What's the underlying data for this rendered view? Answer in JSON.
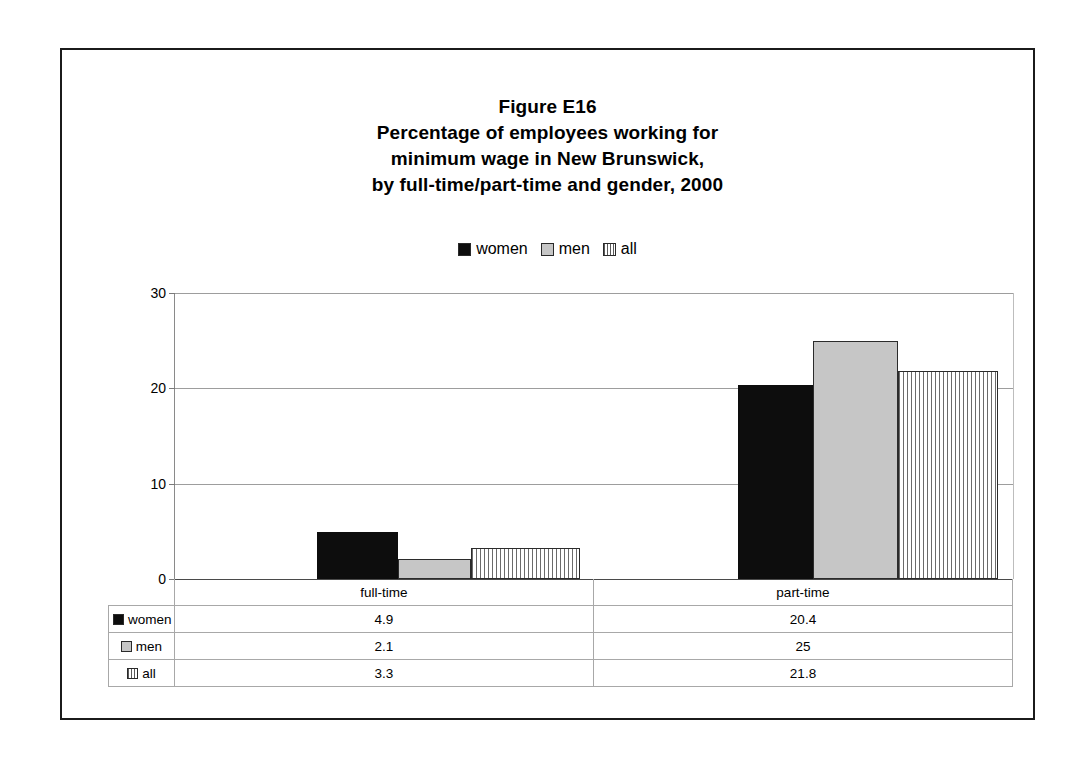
{
  "figure": {
    "title_lines": [
      "Figure E16",
      "Percentage of employees working for",
      "minimum wage in New Brunswick,",
      "by full-time/part-time and gender, 2000"
    ]
  },
  "legend": {
    "items": [
      {
        "label": "women",
        "swatch": "solid-black-swatch-icon",
        "color": "#0d0d0d"
      },
      {
        "label": "men",
        "swatch": "solid-gray-swatch-icon",
        "color": "#c6c6c6"
      },
      {
        "label": "all",
        "swatch": "vertical-stripe-swatch-icon",
        "color": "#ffffff"
      }
    ]
  },
  "axis": {
    "yticks": [
      "0",
      "10",
      "20",
      "30"
    ]
  },
  "table": {
    "row_label_header": "",
    "category_headers": [
      "full-time",
      "part-time"
    ],
    "rows": [
      {
        "label": "women",
        "values": [
          "4.9",
          "20.4"
        ]
      },
      {
        "label": "men",
        "values": [
          "2.1",
          "25"
        ]
      },
      {
        "label": "all",
        "values": [
          "3.3",
          "21.8"
        ]
      }
    ]
  },
  "chart_data": {
    "type": "bar",
    "xlabel": "",
    "ylabel": "",
    "ylim": [
      0,
      30
    ],
    "yticks": [
      0,
      10,
      20,
      30
    ],
    "grid": true,
    "legend_position": "top-center",
    "categories": [
      "full-time",
      "part-time"
    ],
    "series": [
      {
        "name": "women",
        "values": [
          4.9,
          20.4
        ],
        "color": "#0d0d0d",
        "fill": "solid"
      },
      {
        "name": "men",
        "values": [
          2.1,
          25
        ],
        "color": "#c6c6c6",
        "fill": "solid"
      },
      {
        "name": "all",
        "values": [
          3.3,
          21.8
        ],
        "color": "#ffffff",
        "fill": "vertical-stripes"
      }
    ]
  }
}
